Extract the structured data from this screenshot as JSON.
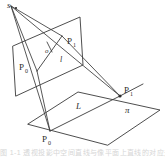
{
  "figure": {
    "caption": "图 1-1  透视投影中空间直线与像平面上直线的对应关系"
  },
  "labels": {
    "apex": "s",
    "origin": "o",
    "image_line": "l",
    "ground_line": "L",
    "ground_plane": "π",
    "image_p0_letter": "P",
    "image_p0_sub": "0",
    "image_p1_letter": "P",
    "image_p1_sub": "1",
    "ground_p0_letter": "P",
    "ground_p0_sub": "0",
    "ground_p1_letter": "P",
    "ground_p1_sub": "1"
  },
  "colors": {
    "stroke": "#3a3a3a",
    "text": "#2b2b2b",
    "background": "#ffffff",
    "caption": "#c9c9c9"
  },
  "geometry": {
    "apex_point": [
      11,
      6
    ],
    "image_plane_quad": "13,46 80,17 83,65 16,96",
    "ground_plane_quad": "28,124 78,92 160,110 108,145",
    "image_triangle": "11,6 62,36 37,71",
    "image_p1_vertex": [
      62,
      36
    ],
    "ground_p1_vertex": [
      120,
      96
    ],
    "ground_line_segment": "50,131 120,96",
    "image_line_segment": "37,71 62,36",
    "origin_tick": [
      50,
      48
    ],
    "rays": [
      "11,6 62,36",
      "11,6 120,96",
      "11,6 37,71",
      "11,6 50,131",
      "62,36 120,96",
      "37,71 50,131"
    ]
  }
}
